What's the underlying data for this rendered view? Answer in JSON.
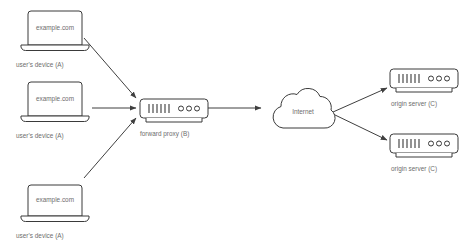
{
  "diagram": {
    "background_color": "#ffffff",
    "stroke_color": "#3a3a3a",
    "text_color": "#6d6d6d",
    "clients": [
      {
        "id": "client-top",
        "screen_label": "example.com",
        "caption": "user's device (A)",
        "icon": "laptop-icon"
      },
      {
        "id": "client-middle",
        "screen_label": "example.com",
        "caption": "user's device (A)",
        "icon": "laptop-icon"
      },
      {
        "id": "client-bottom",
        "screen_label": "example.com",
        "caption": "user's device (A)",
        "icon": "laptop-icon"
      }
    ],
    "proxy": {
      "id": "forward-proxy",
      "caption": "forward proxy (B)",
      "icon": "server-icon",
      "port_bars": 6,
      "indicator_lights": 3
    },
    "cloud": {
      "id": "internet-cloud",
      "label": "Internet",
      "icon": "cloud-icon"
    },
    "origin_servers": [
      {
        "id": "origin-server-top",
        "caption": "origin server (C)",
        "icon": "server-icon",
        "port_bars": 6,
        "indicator_lights": 3
      },
      {
        "id": "origin-server-bottom",
        "caption": "origin server (C)",
        "icon": "server-icon",
        "port_bars": 6,
        "indicator_lights": 3
      }
    ],
    "connections": [
      {
        "id": "conn-client-top-to-proxy",
        "from": "client-top",
        "to": "forward-proxy",
        "arrow": "arrowhead-icon"
      },
      {
        "id": "conn-client-middle-to-proxy",
        "from": "client-middle",
        "to": "forward-proxy",
        "arrow": "arrowhead-icon"
      },
      {
        "id": "conn-client-bottom-to-proxy",
        "from": "client-bottom",
        "to": "forward-proxy",
        "arrow": "arrowhead-icon"
      },
      {
        "id": "conn-proxy-to-internet",
        "from": "forward-proxy",
        "to": "internet-cloud",
        "arrow": "arrowhead-icon"
      },
      {
        "id": "conn-internet-to-origin-top",
        "from": "internet-cloud",
        "to": "origin-server-top",
        "arrow": "arrowhead-icon"
      },
      {
        "id": "conn-internet-to-origin-bottom",
        "from": "internet-cloud",
        "to": "origin-server-bottom",
        "arrow": "arrowhead-icon"
      }
    ]
  }
}
